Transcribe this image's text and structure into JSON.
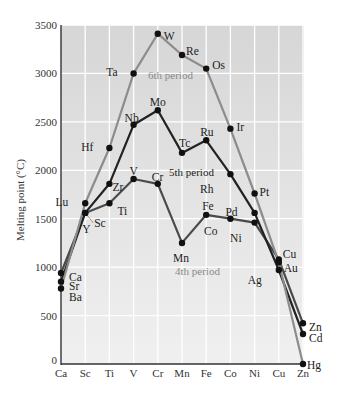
{
  "chart_data": {
    "type": "line",
    "title": "",
    "xlabel": "",
    "ylabel": "Melting point (°C)",
    "ylim": [
      0,
      3500
    ],
    "yticks": [
      0,
      500,
      1000,
      1500,
      2000,
      2500,
      3000,
      3500
    ],
    "categories": [
      "Ca",
      "Sc",
      "Ti",
      "V",
      "Cr",
      "Mn",
      "Fe",
      "Co",
      "Ni",
      "Cu",
      "Zn"
    ],
    "grid": true,
    "legend": "inline labels",
    "series": [
      {
        "name": "4th period",
        "color": "#4a4a4a",
        "label_color": "#8a8a8a",
        "label_pos": [
          175,
          275
        ],
        "points": [
          {
            "el": "Ca",
            "x": 0,
            "y": 940,
            "lx": 8,
            "ly": 4
          },
          {
            "el": "Sc",
            "x": 1,
            "y": 1560,
            "lx": 9,
            "ly": 10
          },
          {
            "el": "Ti",
            "x": 2,
            "y": 1660,
            "lx": 8,
            "ly": 8
          },
          {
            "el": "V",
            "x": 3,
            "y": 1910,
            "lx": -4,
            "ly": -8
          },
          {
            "el": "Cr",
            "x": 4,
            "y": 1860,
            "lx": -6,
            "ly": -7
          },
          {
            "el": "Mn",
            "x": 5,
            "y": 1250,
            "lx": -9,
            "ly": 15
          },
          {
            "el": "Fe",
            "x": 6,
            "y": 1540,
            "lx": -4,
            "ly": -9
          },
          {
            "el": "Co",
            "x": 7,
            "y": 1500,
            "lx": -13,
            "ly": 12
          },
          {
            "el": "Ni",
            "x": 8,
            "y": 1460,
            "lx": -13,
            "ly": 15
          },
          {
            "el": "Cu",
            "x": 9,
            "y": 1080,
            "lx": 4,
            "ly": -5
          },
          {
            "el": "Zn",
            "x": 10,
            "y": 420,
            "lx": 6,
            "ly": 4
          }
        ]
      },
      {
        "name": "5th period",
        "color": "#222222",
        "label_color": "#222222",
        "label_pos": [
          169,
          176
        ],
        "points": [
          {
            "el": "Sr",
            "x": 0,
            "y": 850,
            "lx": 8,
            "ly": 4
          },
          {
            "el": "Y",
            "x": 1,
            "y": 1560,
            "lx": -3,
            "ly": 16
          },
          {
            "el": "Zr",
            "x": 2,
            "y": 1860,
            "lx": 3,
            "ly": 3
          },
          {
            "el": "Nb",
            "x": 3,
            "y": 2470,
            "lx": -9,
            "ly": -7
          },
          {
            "el": "Mo",
            "x": 4,
            "y": 2620,
            "lx": -8,
            "ly": -8
          },
          {
            "el": "Tc",
            "x": 5,
            "y": 2180,
            "lx": -3,
            "ly": -10
          },
          {
            "el": "Ru",
            "x": 6,
            "y": 2310,
            "lx": -6,
            "ly": -8
          },
          {
            "el": "Rh",
            "x": 7,
            "y": 1960,
            "lx": -17,
            "ly": 15
          },
          {
            "el": "Pd",
            "x": 8,
            "y": 1560,
            "lx": -17,
            "ly": -1
          },
          {
            "el": "Ag",
            "x": 9,
            "y": 970,
            "lx": -17,
            "ly": 10
          },
          {
            "el": "Cd",
            "x": 10,
            "y": 310,
            "lx": 6,
            "ly": 4
          }
        ]
      },
      {
        "name": "6th period",
        "color": "#8c8c8c",
        "label_color": "#8a8a8a",
        "label_pos": [
          148,
          79
        ],
        "points": [
          {
            "el": "Ba",
            "x": 0,
            "y": 780,
            "lx": 8,
            "ly": 9
          },
          {
            "el": "Lu",
            "x": 1,
            "y": 1660,
            "lx": -17,
            "ly": -1
          },
          {
            "el": "Hf",
            "x": 2,
            "y": 2230,
            "lx": -16,
            "ly": -1
          },
          {
            "el": "Ta",
            "x": 3,
            "y": 3000,
            "lx": -16,
            "ly": -1
          },
          {
            "el": "W",
            "x": 4,
            "y": 3410,
            "lx": 6,
            "ly": 2
          },
          {
            "el": "Re",
            "x": 5,
            "y": 3190,
            "lx": 4,
            "ly": -4
          },
          {
            "el": "Os",
            "x": 6,
            "y": 3050,
            "lx": 6,
            "ly": -4
          },
          {
            "el": "Ir",
            "x": 7,
            "y": 2430,
            "lx": 6,
            "ly": -2
          },
          {
            "el": "Pt",
            "x": 8,
            "y": 1760,
            "lx": 5,
            "ly": -2
          },
          {
            "el": "Au",
            "x": 9,
            "y": 1050,
            "lx": 5,
            "ly": 6
          },
          {
            "el": "Hg",
            "x": 10,
            "y": 0,
            "lx": 4,
            "ly": 1
          }
        ]
      }
    ]
  }
}
